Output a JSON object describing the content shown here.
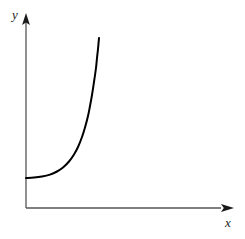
{
  "figure": {
    "background_color": "#ffffff",
    "width": 245,
    "height": 239
  },
  "axes": {
    "color": "#555555",
    "line_width": 1.2,
    "origin": {
      "x": 26,
      "y": 208
    },
    "x_axis": {
      "label": "x",
      "start": {
        "x": 26,
        "y": 208
      },
      "end": {
        "x": 233,
        "y": 208
      },
      "arrowhead": true,
      "label_position": {
        "x": 225,
        "y": 216
      }
    },
    "y_axis": {
      "label": "y",
      "start": {
        "x": 26,
        "y": 208
      },
      "end": {
        "x": 26,
        "y": 14
      },
      "arrowhead": true,
      "label_position": {
        "x": 12,
        "y": 8
      }
    }
  },
  "chart_data": {
    "type": "line",
    "title": "",
    "xlabel": "x",
    "ylabel": "y",
    "grid": false,
    "legend": null,
    "ticks": {
      "x": [],
      "y": []
    },
    "series": [
      {
        "name": "exponential-curve",
        "color": "#000000",
        "line_width": 2,
        "description": "Monotonically increasing exponential-shaped curve, flat near the y-axis then rising steeply",
        "points_px": [
          [
            26,
            178
          ],
          [
            34,
            177.6
          ],
          [
            42,
            176.6
          ],
          [
            50,
            174.6
          ],
          [
            57,
            171.5
          ],
          [
            63,
            167.5
          ],
          [
            69,
            161.5
          ],
          [
            74,
            154.5
          ],
          [
            78,
            147.0
          ],
          [
            82,
            137.0
          ],
          [
            85,
            127.5
          ],
          [
            88,
            116.0
          ],
          [
            90,
            106.0
          ],
          [
            92,
            95.0
          ],
          [
            94,
            82.0
          ],
          [
            96,
            68.0
          ],
          [
            97,
            58.0
          ],
          [
            98,
            49.0
          ],
          [
            99,
            38.0
          ]
        ]
      }
    ]
  }
}
